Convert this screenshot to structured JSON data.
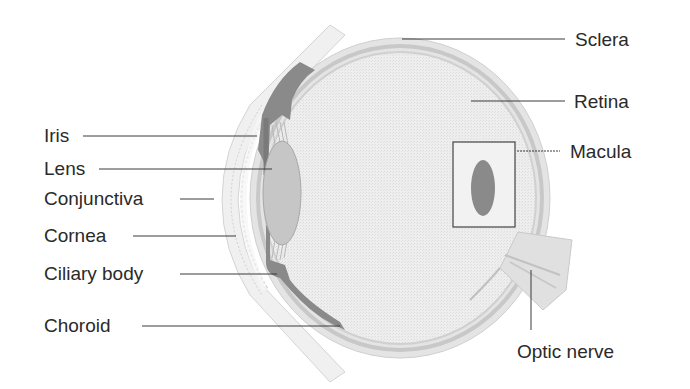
{
  "diagram": {
    "type": "anatomical-cross-section",
    "colors": {
      "background": "#ffffff",
      "eyeball_fill": "#ececec",
      "sclera_band": "#d8d8d8",
      "iris_ciliary": "#8c8c8c",
      "lens": "#c4c4c4",
      "macula": "#8a8a8a",
      "leader_line": "#3a3a3a",
      "text": "#2a2a2a"
    },
    "labels": {
      "left": [
        {
          "id": "iris",
          "text": "Iris"
        },
        {
          "id": "lens",
          "text": "Lens"
        },
        {
          "id": "conjunctiva",
          "text": "Conjunctiva"
        },
        {
          "id": "cornea",
          "text": "Cornea"
        },
        {
          "id": "ciliary_body",
          "text": "Ciliary body"
        },
        {
          "id": "choroid",
          "text": "Choroid"
        }
      ],
      "right": [
        {
          "id": "sclera",
          "text": "Sclera"
        },
        {
          "id": "retina",
          "text": "Retina"
        },
        {
          "id": "macula",
          "text": "Macula"
        },
        {
          "id": "optic_nerve",
          "text": "Optic nerve"
        }
      ]
    }
  }
}
